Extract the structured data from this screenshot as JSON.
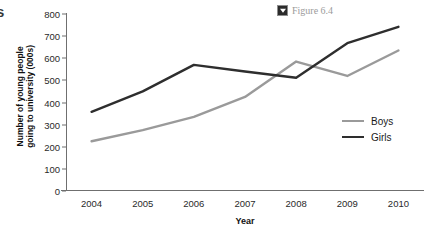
{
  "caption": {
    "marker_icon": "triangle-down-icon",
    "text": "Figure 6.4"
  },
  "edge_glyph": "s",
  "chart_data": {
    "type": "line",
    "title": "",
    "xlabel": "Year",
    "ylabel": "Number of young people going to university (000s)",
    "ylabel_line1": "Number of young people",
    "ylabel_line2": "going to university (000s)",
    "categories": [
      "2004",
      "2005",
      "2006",
      "2007",
      "2008",
      "2009",
      "2010"
    ],
    "x": [
      2004,
      2005,
      2006,
      2007,
      2008,
      2009,
      2010
    ],
    "ylim": [
      0,
      800
    ],
    "ytick_values": [
      0,
      100,
      200,
      300,
      400,
      500,
      600,
      700,
      800
    ],
    "ytick_labels": [
      "0",
      "100",
      "200",
      "300",
      "400",
      "500",
      "600",
      "700",
      "800"
    ],
    "grid": false,
    "legend_position": "right",
    "series": [
      {
        "name": "Boys",
        "color": "#9a9a9a",
        "values": [
          225,
          275,
          335,
          425,
          585,
          520,
          635
        ]
      },
      {
        "name": "Girls",
        "color": "#2e2e2e",
        "values": [
          358,
          450,
          570,
          540,
          512,
          668,
          742
        ]
      }
    ]
  },
  "legend": {
    "items": [
      {
        "label": "Boys",
        "color": "#9a9a9a"
      },
      {
        "label": "Girls",
        "color": "#2e2e2e"
      }
    ]
  }
}
